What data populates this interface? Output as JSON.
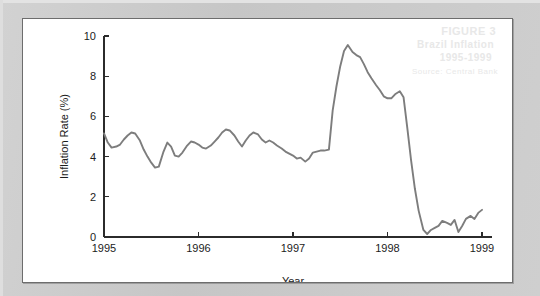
{
  "figure": {
    "background_color": "#ffffff",
    "page_color": "#c9c9c9",
    "border_color": "#6d6d6d"
  },
  "ghost_text": {
    "line1": "FIGURE 3",
    "line2": "Brazil Inflation",
    "line3": "1995-1999",
    "line4": "Source: Central Bank"
  },
  "chart_data": {
    "type": "line",
    "title": "",
    "subtitle": "",
    "xlabel": "Year",
    "ylabel": "Inflation Rate (%)",
    "xlim": [
      1995.0,
      1999.0
    ],
    "ylim": [
      0,
      10
    ],
    "xticks": [
      1995,
      1996,
      1997,
      1998,
      1999
    ],
    "xtick_labels": [
      "1995",
      "1996",
      "1997",
      "1998",
      "1999"
    ],
    "yticks": [
      0,
      2,
      4,
      6,
      8,
      10
    ],
    "ytick_labels": [
      "0",
      "2",
      "4",
      "6",
      "8",
      "10"
    ],
    "grid": false,
    "legend": null,
    "legend_position": "none",
    "series": [
      {
        "name": "Inflation Rate",
        "color": "#7d7d7d",
        "line_width": 1.9,
        "x": [
          1995.0,
          1995.04,
          1995.08,
          1995.13,
          1995.17,
          1995.21,
          1995.25,
          1995.29,
          1995.33,
          1995.38,
          1995.42,
          1995.46,
          1995.5,
          1995.54,
          1995.58,
          1995.63,
          1995.67,
          1995.71,
          1995.75,
          1995.79,
          1995.83,
          1995.88,
          1995.92,
          1995.96,
          1996.0,
          1996.04,
          1996.08,
          1996.13,
          1996.17,
          1996.21,
          1996.25,
          1996.29,
          1996.33,
          1996.38,
          1996.42,
          1996.46,
          1996.5,
          1996.54,
          1996.58,
          1996.63,
          1996.67,
          1996.71,
          1996.75,
          1996.79,
          1996.83,
          1996.88,
          1996.92,
          1996.96,
          1997.0,
          1997.04,
          1997.08,
          1997.13,
          1997.17,
          1997.21,
          1997.25,
          1997.29,
          1997.33,
          1997.38,
          1997.42,
          1997.46,
          1997.5,
          1997.54,
          1997.58,
          1997.63,
          1997.67,
          1997.71,
          1997.75,
          1997.79,
          1997.83,
          1997.88,
          1997.92,
          1997.96,
          1998.0,
          1998.04,
          1998.08,
          1998.13,
          1998.17,
          1998.21,
          1998.25,
          1998.29,
          1998.33,
          1998.38,
          1998.42,
          1998.46,
          1998.5,
          1998.54,
          1998.58,
          1998.63,
          1998.67,
          1998.71,
          1998.75,
          1998.79,
          1998.83,
          1998.88,
          1998.92,
          1998.96,
          1999.0
        ],
        "values": [
          5.15,
          4.7,
          4.45,
          4.5,
          4.6,
          4.85,
          5.05,
          5.2,
          5.15,
          4.8,
          4.35,
          4.0,
          3.7,
          3.45,
          3.5,
          4.25,
          4.7,
          4.5,
          4.05,
          4.0,
          4.2,
          4.55,
          4.75,
          4.7,
          4.6,
          4.45,
          4.4,
          4.55,
          4.75,
          4.95,
          5.2,
          5.35,
          5.3,
          5.05,
          4.75,
          4.5,
          4.8,
          5.05,
          5.2,
          5.1,
          4.85,
          4.7,
          4.8,
          4.7,
          4.55,
          4.4,
          4.25,
          4.15,
          4.05,
          3.9,
          3.95,
          3.75,
          3.9,
          4.2,
          4.25,
          4.3,
          4.3,
          4.35,
          6.3,
          7.5,
          8.5,
          9.25,
          9.55,
          9.2,
          9.05,
          8.95,
          8.6,
          8.2,
          7.9,
          7.55,
          7.3,
          7.0,
          6.9,
          6.9,
          7.1,
          7.25,
          6.95,
          5.4,
          3.8,
          2.4,
          1.3,
          0.35,
          0.15,
          0.35,
          0.45,
          0.55,
          0.8,
          0.7,
          0.6,
          0.85,
          0.25,
          0.55,
          0.9,
          1.05,
          0.9,
          1.2,
          1.35
        ]
      }
    ]
  },
  "plot_geometry": {
    "left": 103,
    "right": 481,
    "top": 35,
    "bottom": 236
  }
}
